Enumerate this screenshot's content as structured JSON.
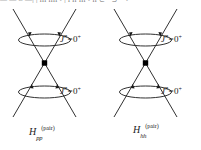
{
  "figure": {
    "top_cropped_text": "— — ≈ —| | ııı ıııı • | ı ıı ııı • ıı ⊂  ᵒ  ⊃  ⁻  •  ⁴  ᵒᵒ  ᵒᵒ⁺",
    "background_color": "#ffffff",
    "line_color": "#1a1a1a",
    "vertex_color": "#000000"
  },
  "diagrams": [
    {
      "id": "pp-diagram",
      "caption": {
        "base": "H",
        "subscript": "pp",
        "superscript": "(pair)"
      },
      "upper_label": {
        "symbol": "J",
        "symbol_superscript": "π",
        "relation": "=",
        "value": "0",
        "value_superscript": "+"
      },
      "lower_label": {
        "symbol": "J",
        "symbol_superscript": "π",
        "relation": "=",
        "value": "0",
        "value_superscript": "+"
      },
      "upper_arrow_direction": "down",
      "lower_arrow_direction": "up"
    },
    {
      "id": "hh-diagram",
      "caption": {
        "base": "H",
        "subscript": "hh",
        "superscript": "(pair)"
      },
      "upper_label": {
        "symbol": "J",
        "symbol_superscript": "π",
        "relation": "=",
        "value": "0",
        "value_superscript": "+"
      },
      "lower_label": {
        "symbol": "J",
        "symbol_superscript": "π",
        "relation": "=",
        "value": "0",
        "value_superscript": "+"
      },
      "upper_arrow_direction": "down",
      "lower_arrow_direction": "up"
    }
  ]
}
